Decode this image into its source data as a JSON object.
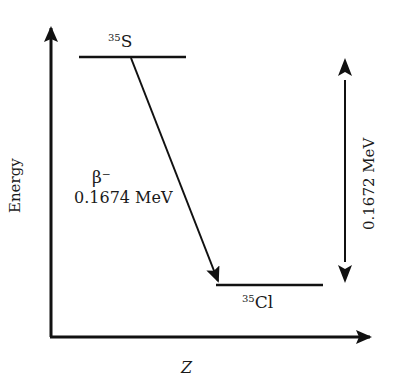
{
  "diagram": {
    "type": "energy-level-decay-scheme",
    "axes": {
      "y_label": "Energy",
      "x_label": "Z"
    },
    "parent": {
      "mass_number": "35",
      "symbol": "S"
    },
    "daughter": {
      "mass_number": "35",
      "symbol": "Cl"
    },
    "transition": {
      "type": "β⁻",
      "energy": "0.1674 MeV"
    },
    "energy_gap": {
      "label": "0.1672 MeV"
    },
    "colors": {
      "line": "#111111",
      "text": "#1a1a1a",
      "background": "#ffffff"
    }
  }
}
